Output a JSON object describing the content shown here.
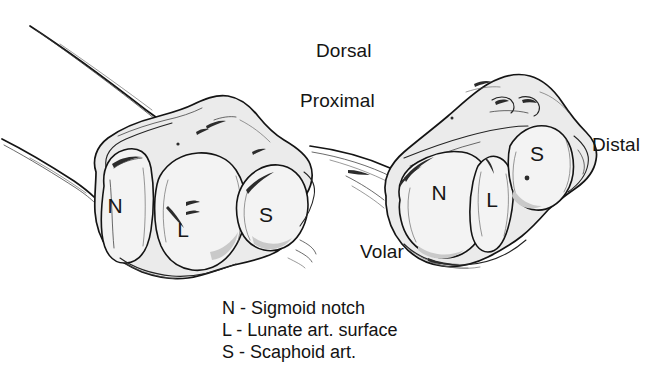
{
  "figure": {
    "background_color": "#ffffff",
    "ink_color": "#141414",
    "bone_fill_color": "#ebebeb",
    "articular_fill_color": "#f2f2f2"
  },
  "orientation_labels": {
    "dorsal": "Dorsal",
    "proximal": "Proximal",
    "volar": "Volar",
    "distal": "Distal"
  },
  "legend": {
    "lines": [
      "N - Sigmoid notch",
      "L - Lunate art. surface",
      "S - Scaphoid art."
    ],
    "entries": [
      {
        "key": "N",
        "separator": "-",
        "term": "Sigmoid notch"
      },
      {
        "key": "L",
        "separator": "-",
        "term": "Lunate art. surface"
      },
      {
        "key": "S",
        "separator": "-",
        "term": "Scaphoid art."
      }
    ]
  },
  "specimens": [
    {
      "name": "left-view-bone",
      "description": "En-face view of distal radius articular surface",
      "regions": [
        {
          "code": "N",
          "name": "sigmoid-notch",
          "x": 115,
          "y": 207
        },
        {
          "code": "L",
          "name": "lunate-articular-surface",
          "x": 183,
          "y": 231
        },
        {
          "code": "S",
          "name": "scaphoid-articular-surface",
          "x": 266,
          "y": 216
        }
      ]
    },
    {
      "name": "right-view-bone",
      "description": "Oblique view of distal radius articular surface",
      "regions": [
        {
          "code": "N",
          "name": "sigmoid-notch",
          "x": 439,
          "y": 194
        },
        {
          "code": "L",
          "name": "lunate-articular-surface",
          "x": 492,
          "y": 201
        },
        {
          "code": "S",
          "name": "scaphoid-articular-surface",
          "x": 537,
          "y": 155
        }
      ]
    }
  ]
}
